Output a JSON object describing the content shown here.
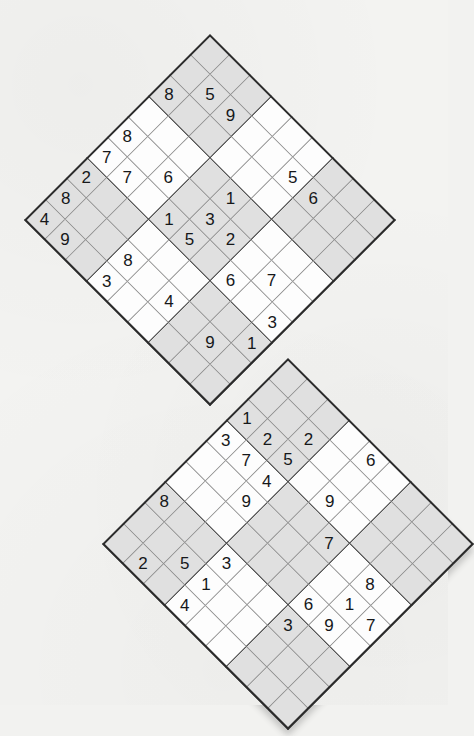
{
  "puzzle": {
    "type": "samurai-sudoku-two-grid-diamond",
    "orientation_deg": 45,
    "grid_size": 9,
    "box_size": 3,
    "shading": "alternate-3x3-boxes",
    "colors": {
      "page_background": "#f3f3f1",
      "cell_background": "#fdfdfd",
      "cell_shaded_background": "#e0e0e0",
      "thin_line": "#8d8d8d",
      "thick_line": "#2a2a2a",
      "digit": "#16181a",
      "shadow": "rgba(90,90,90,0.30)"
    },
    "grids": [
      {
        "name": "upper-grid",
        "label": "Upper diamond sudoku grid",
        "top_vertex": [
          210,
          34
        ],
        "cell_px": 29.2,
        "shaded_boxes": [
          1,
          3,
          5,
          7,
          9
        ],
        "rows": [
          [
            "",
            "",
            "",
            "",
            "",
            "",
            "",
            "",
            ""
          ],
          [
            "",
            "5",
            "9",
            "",
            "",
            "5",
            "6",
            "",
            ""
          ],
          [
            "8",
            "",
            "",
            "",
            "",
            "",
            "",
            "",
            ""
          ],
          [
            "",
            "",
            "",
            "",
            "1",
            "",
            "",
            "",
            ""
          ],
          [
            "8",
            "",
            "6",
            "",
            "3",
            "2",
            "",
            "7",
            ""
          ],
          [
            "7",
            "7",
            "",
            "1",
            "5",
            "",
            "6",
            "",
            "3"
          ],
          [
            "2",
            "",
            "",
            "",
            "",
            "",
            "",
            "",
            "1"
          ],
          [
            "8",
            "",
            "",
            "8",
            "",
            "4",
            "",
            "9",
            ""
          ],
          [
            "4",
            "9",
            "",
            "3",
            "",
            "",
            "",
            "",
            ""
          ]
        ]
      },
      {
        "name": "lower-grid",
        "label": "Lower diamond sudoku grid",
        "top_vertex": [
          288,
          358
        ],
        "cell_px": 29.2,
        "shaded_boxes": [
          1,
          3,
          5,
          7,
          9
        ],
        "rows": [
          [
            "",
            "",
            "",
            "",
            "6",
            "",
            "",
            "",
            ""
          ],
          [
            "",
            "",
            "2",
            "",
            "",
            "",
            "",
            "",
            ""
          ],
          [
            "1",
            "2",
            "5",
            "",
            "9",
            "",
            "",
            "",
            ""
          ],
          [
            "3",
            "7",
            "4",
            "",
            "",
            "7",
            "",
            "8",
            ""
          ],
          [
            "",
            "",
            "9",
            "",
            "",
            "",
            "",
            "1",
            "7"
          ],
          [
            "",
            "",
            "",
            "",
            "",
            "",
            "6",
            "9",
            ""
          ],
          [
            "8",
            "",
            "",
            "3",
            "",
            "",
            "3",
            "",
            ""
          ],
          [
            "",
            "",
            "5",
            "1",
            "",
            "",
            "",
            "",
            ""
          ],
          [
            "",
            "2",
            "",
            "4",
            "",
            "",
            "",
            "",
            ""
          ]
        ],
        "bottom_vertex": [
          218,
          668
        ]
      }
    ],
    "given_digits_upper": [
      "5",
      "9",
      "5",
      "6",
      "8",
      "1",
      "8",
      "6",
      "3",
      "2",
      "7",
      "7",
      "7",
      "1",
      "5",
      "6",
      "3",
      "2",
      "1",
      "8",
      "8",
      "4",
      "9",
      "4",
      "9",
      "3"
    ],
    "given_digits_lower": [
      "6",
      "2",
      "1",
      "2",
      "5",
      "9",
      "3",
      "7",
      "4",
      "7",
      "8",
      "9",
      "1",
      "7",
      "6",
      "9",
      "8",
      "3",
      "3",
      "5",
      "1",
      "2",
      "4"
    ]
  }
}
